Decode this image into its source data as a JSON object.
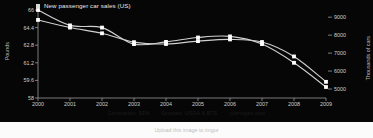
{
  "legend": {
    "label": "New passenger car sales (US)",
    "marker_color": "#d8d8d8"
  },
  "axes": {
    "left_title": "Pounds",
    "right_title": "Thousands of cars",
    "left_ticks": [
      "66",
      "64.4",
      "62.8",
      "61.2",
      "59.6",
      "58"
    ],
    "right_ticks": [
      "9000",
      "8000",
      "7000",
      "6000",
      "5000"
    ],
    "x_ticks": [
      "2000",
      "2001",
      "2002",
      "2003",
      "2004",
      "2005",
      "2006",
      "2007",
      "2008",
      "2009"
    ]
  },
  "caption": {
    "correlation": "Correlation: 99%",
    "sources": "Sources: USDA & BTS",
    "site": "tylervigen.com"
  },
  "upload_bar": {
    "text": "Upload this image to imgur"
  },
  "colors": {
    "background": "#060606",
    "line": "#d0d0d0",
    "point": "#ffffff",
    "text": "#cfcfcf"
  },
  "chart_data": {
    "type": "line",
    "title": "",
    "xlabel": "",
    "ylabel": "Pounds",
    "y2label": "Thousands of cars",
    "x": [
      2000,
      2001,
      2002,
      2003,
      2004,
      2005,
      2006,
      2007,
      2008,
      2009
    ],
    "ylim": [
      58,
      66
    ],
    "y2lim": [
      4500,
      9400
    ],
    "grid": false,
    "legend_position": "top-left",
    "series": [
      {
        "name": "Per capita consumption of beef (US)",
        "axis": "left",
        "units": "Pounds",
        "values": [
          66.0,
          64.6,
          64.4,
          62.9,
          63.1,
          63.5,
          63.6,
          62.9,
          61.2,
          59.0
        ]
      },
      {
        "name": "New passenger car sales (US)",
        "axis": "right",
        "units": "Thousands of cars",
        "values": [
          8847,
          8423,
          8103,
          7610,
          7506,
          7667,
          7762,
          7618,
          6813,
          5400
        ]
      }
    ]
  }
}
